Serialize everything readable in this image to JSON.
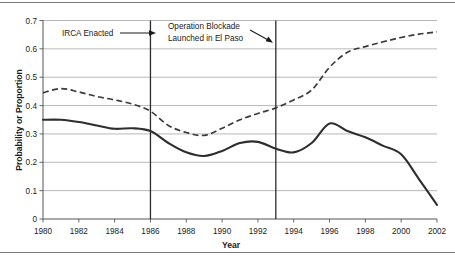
{
  "figure": {
    "name": "line-chart-probability-proportion-by-year"
  },
  "chart_data": {
    "type": "line",
    "title": "",
    "xlabel": "Year",
    "ylabel": "Probability or Proportion",
    "xlim": [
      1980,
      2002
    ],
    "ylim": [
      0,
      0.7
    ],
    "grid": true,
    "legend": "none",
    "y_ticks": [
      "0",
      "0.1",
      "0.2",
      "0.3",
      "0.4",
      "0.5",
      "0.6",
      "0.7"
    ],
    "y_tick_values": [
      0,
      0.1,
      0.2,
      0.3,
      0.4,
      0.5,
      0.6,
      0.7
    ],
    "x_ticks": [
      "1980",
      "1982",
      "1984",
      "1986",
      "1988",
      "1990",
      "1992",
      "1994",
      "1996",
      "1998",
      "2000",
      "2002"
    ],
    "x_tick_values": [
      1980,
      1982,
      1984,
      1986,
      1988,
      1990,
      1992,
      1994,
      1996,
      1998,
      2000,
      2002
    ],
    "x": [
      1980,
      1981,
      1982,
      1983,
      1984,
      1985,
      1986,
      1987,
      1988,
      1989,
      1990,
      1991,
      1992,
      1993,
      1994,
      1995,
      1996,
      1997,
      1998,
      1999,
      2000,
      2001,
      2002
    ],
    "series": [
      {
        "name": "solid-series",
        "style": "solid",
        "color": "#2e2e2e",
        "values": [
          0.35,
          0.35,
          0.342,
          0.33,
          0.318,
          0.32,
          0.31,
          0.268,
          0.235,
          0.222,
          0.24,
          0.268,
          0.272,
          0.248,
          0.235,
          0.268,
          0.337,
          0.31,
          0.288,
          0.258,
          0.228,
          0.14,
          0.05
        ]
      },
      {
        "name": "dashed-series",
        "style": "dashed",
        "color": "#3a3a3a",
        "values": [
          0.445,
          0.46,
          0.448,
          0.432,
          0.42,
          0.405,
          0.38,
          0.33,
          0.305,
          0.295,
          0.32,
          0.35,
          0.372,
          0.392,
          0.42,
          0.455,
          0.535,
          0.588,
          0.608,
          0.625,
          0.64,
          0.652,
          0.66
        ]
      }
    ],
    "annotations": [
      {
        "name": "irca-annotation",
        "label": "IRCA Enacted",
        "line_year": 1986,
        "arrow": "right"
      },
      {
        "name": "operation-blockade-annotation",
        "label_line1": "Operation Blockade",
        "label_line2": "Launched in El Paso",
        "line_year": 1993,
        "arrow": "down-right"
      }
    ]
  }
}
